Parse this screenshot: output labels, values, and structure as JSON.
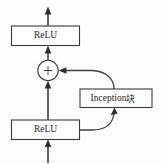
{
  "diagram": {
    "background_color": "#fdfdfd",
    "line_color": "#3f3f3f",
    "box_fill": "#ffffff",
    "nodes": {
      "relu_top": {
        "label": "ReLU",
        "name": "relu-top-box"
      },
      "add_node": {
        "label": "+",
        "name": "addition-node"
      },
      "inception": {
        "label_latin": "Inception",
        "label_cjk": "块",
        "label_full": "Inception块",
        "name": "inception-block-box"
      },
      "relu_bottom": {
        "label": "ReLU",
        "name": "relu-bottom-box"
      }
    },
    "edges": [
      {
        "name": "input-to-relu-bottom",
        "kind": "arrow-up"
      },
      {
        "name": "relu-bottom-to-add",
        "kind": "arrow-up"
      },
      {
        "name": "add-to-relu-top",
        "kind": "arrow-up"
      },
      {
        "name": "relu-top-to-output",
        "kind": "arrow-up"
      },
      {
        "name": "relu-bottom-to-inception",
        "kind": "curve-arrow-up"
      },
      {
        "name": "inception-to-add",
        "kind": "curve-arrow-left"
      }
    ]
  }
}
